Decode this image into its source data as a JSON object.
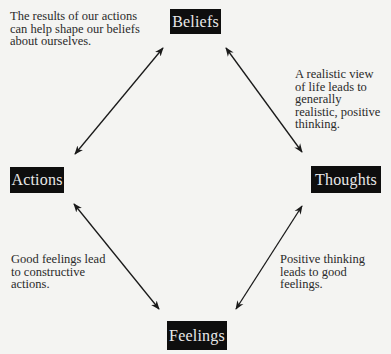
{
  "diagram": {
    "nodes": {
      "beliefs": "Beliefs",
      "thoughts": "Thoughts",
      "feelings": "Feelings",
      "actions": "Actions"
    },
    "edges": [
      {
        "from": "actions",
        "to": "beliefs",
        "direction": "bidirectional"
      },
      {
        "from": "beliefs",
        "to": "thoughts",
        "direction": "bidirectional"
      },
      {
        "from": "thoughts",
        "to": "feelings",
        "direction": "bidirectional"
      },
      {
        "from": "feelings",
        "to": "actions",
        "direction": "bidirectional"
      }
    ],
    "notes": {
      "actions_beliefs": "The results of our actions\ncan help shape our beliefs\nabout ourselves.",
      "beliefs_thoughts": "A realistic view\nof life leads to\ngenerally\nrealistic, positive\nthinking.",
      "feelings_actions": "Good feelings lead\nto constructive\nactions.",
      "thoughts_feelings": "Positive thinking\nleads to good\nfeelings."
    },
    "colors": {
      "background": "#f4f4f2",
      "node_fill": "#0e0e0e",
      "node_text": "#e8e8e8",
      "arrow": "#1a1a1a",
      "note_text": "#2a2a2a"
    }
  }
}
